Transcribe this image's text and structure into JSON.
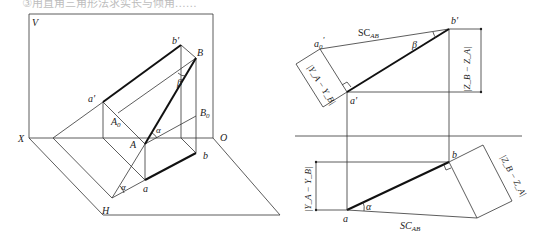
{
  "header": {
    "cut_text": "③用直角三角形法求实长与倾角……"
  },
  "left_diagram": {
    "plane_labels": {
      "V": "V",
      "H": "H",
      "X": "X",
      "O": "O"
    },
    "points": {
      "a_prime": "a'",
      "b_prime": "b'",
      "A": "A",
      "B": "B",
      "A0": "A",
      "A0_sub": "0",
      "B0": "B",
      "B0_sub": "0",
      "a": "a",
      "b": "b"
    },
    "angles": {
      "alpha": "α",
      "beta": "β"
    }
  },
  "right_top": {
    "points": {
      "a0_prime": "a",
      "a0_prime_sub": "0",
      "a0_prime_sup": "'",
      "a_prime": "a'",
      "b_prime": "b'"
    },
    "true_length": "SC",
    "true_length_sub": "AB",
    "angle": "β",
    "dim_y": "|Y",
    "dim_y_full": "|Y_A − Y_B|",
    "dim_z_full": "|Z_B − Z_A|"
  },
  "right_bottom": {
    "points": {
      "a": "a",
      "b": "b"
    },
    "true_length": "SC",
    "true_length_sub": "AB",
    "angle": "α",
    "dim_y_full": "|Y_A − Y_B|",
    "dim_z_full": "|Z_B − Z_A|"
  }
}
